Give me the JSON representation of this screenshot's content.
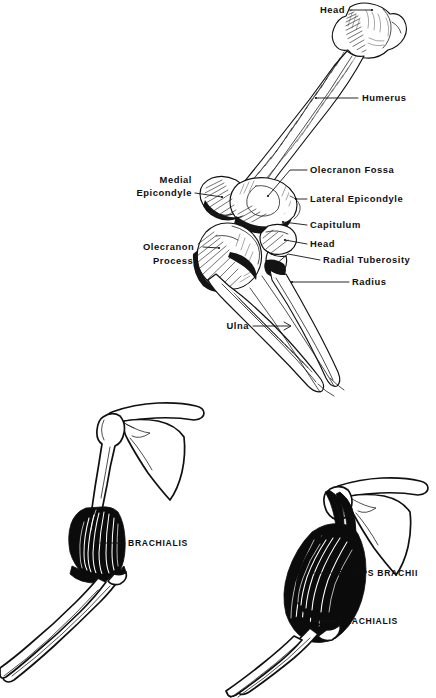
{
  "plate": {
    "background_color": "#ffffff",
    "ink_color": "#111111",
    "title": "",
    "panels": [
      {
        "id": "upper-skeleton",
        "name": "humerus-elbow-forearm-skeleton",
        "description": "Right humerus with elbow joint, radius and ulna, anterior view, stipple shaded line drawing"
      },
      {
        "id": "lower-left-brachialis",
        "name": "arm-brachialis-figure",
        "description": "Shoulder girdle with clavicle and scapula, humerus with brachialis muscle, radius and ulna"
      },
      {
        "id": "lower-right-biceps",
        "name": "arm-biceps-brachialis-figure",
        "description": "Shoulder girdle with scapula, humerus with biceps brachii overlying brachialis, radius and ulna"
      }
    ]
  },
  "upper_labels": {
    "head_humerus": "Head",
    "humerus": "Humerus",
    "medial_epicondyle_line1": "Medial",
    "medial_epicondyle_line2": "Epicondyle",
    "olecranon_fossa": "Olecranon  Fossa",
    "lateral_epicondyle": "Lateral  Epicondyle",
    "capitulum": "Capitulum",
    "head_radius": "Head",
    "olecranon_process_line1": "Olecranon",
    "olecranon_process_line2": "Process",
    "radial_tuberosity": "Radial  Tuberosity",
    "radius": "Radius",
    "ulna": "Ulna"
  },
  "lower_left_labels": {
    "brachialis": "BRACHIALIS"
  },
  "lower_right_labels": {
    "biceps_brachii": "BICEPS BRACHII",
    "brachialis": "BRACHIALIS"
  }
}
